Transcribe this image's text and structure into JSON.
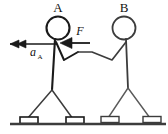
{
  "diagram": {
    "type": "free-body-physics-sketch",
    "labels": {
      "person_a": "A",
      "person_b": "B",
      "force": "F",
      "acceleration_symbol": "a",
      "acceleration_subscript": "A"
    },
    "colors": {
      "ink_dark": "#1a1a1a",
      "ink_grey": "#5a5a5a",
      "ground": "#3c3c3c",
      "background": "#ffffff",
      "skate_fill": "#ffffff"
    },
    "vectors": [
      {
        "name": "acceleration-vector",
        "label": "a_A",
        "direction": "left",
        "arrowhead": "double",
        "from_x": 57,
        "to_x": 8,
        "y": 44
      },
      {
        "name": "force-vector",
        "label": "F",
        "direction": "left",
        "arrowhead": "single",
        "from_x": 88,
        "to_x": 61,
        "y": 43
      }
    ],
    "figures": [
      {
        "name": "person-a",
        "label": "A",
        "head_cx": 58,
        "head_cy": 28,
        "head_r": 11
      },
      {
        "name": "person-b",
        "label": "B",
        "head_cx": 124,
        "head_cy": 28,
        "head_r": 11
      }
    ],
    "skates": [
      {
        "name": "skate-a-left",
        "x": 22,
        "y": 118
      },
      {
        "name": "skate-a-right",
        "x": 68,
        "y": 118
      },
      {
        "name": "skate-b-left",
        "x": 103,
        "y": 117
      },
      {
        "name": "skate-b-right",
        "x": 145,
        "y": 117
      }
    ],
    "ground": {
      "name": "ground-line",
      "x1": 10,
      "x2": 166,
      "y": 124
    }
  }
}
